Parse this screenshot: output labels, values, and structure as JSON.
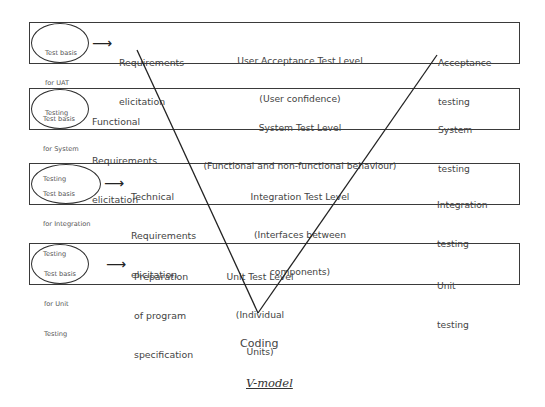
{
  "diagram": {
    "title": "V-model",
    "bottom_label": "Coding",
    "levels": [
      {
        "test_basis": [
          "Test basis",
          "for UAT",
          "Testing"
        ],
        "requirement": [
          "Requirements",
          "elicitation"
        ],
        "has_arrow": true,
        "test_level": [
          "User Acceptance Test Level",
          "(User confidence)"
        ],
        "testing": [
          "Acceptance",
          "testing"
        ]
      },
      {
        "test_basis": [
          "Test basis",
          "for System",
          "Testing"
        ],
        "requirement": [
          "Functional",
          "Requirements",
          "elicitation"
        ],
        "has_arrow": false,
        "test_level": [
          "System Test Level",
          "(Functional and non-functional behaviour)"
        ],
        "testing": [
          "System",
          "testing"
        ]
      },
      {
        "test_basis": [
          "Test basis",
          "for Integration",
          "Testing"
        ],
        "requirement": [
          "Technical",
          "Requirements",
          "elicitation"
        ],
        "has_arrow": true,
        "test_level": [
          "Integration Test Level",
          "(Interfaces between",
          "components)"
        ],
        "testing": [
          "Integration",
          "testing"
        ]
      },
      {
        "test_basis": [
          "Test basis",
          "for Unit",
          "Testing"
        ],
        "requirement": [
          "Preparation",
          "of program",
          "specification"
        ],
        "has_arrow": true,
        "test_level": [
          "Unit Test Level",
          "(Individual",
          "Units)"
        ],
        "testing": [
          "Unit",
          "testing"
        ]
      }
    ],
    "arrow_glyph": "⟶"
  }
}
